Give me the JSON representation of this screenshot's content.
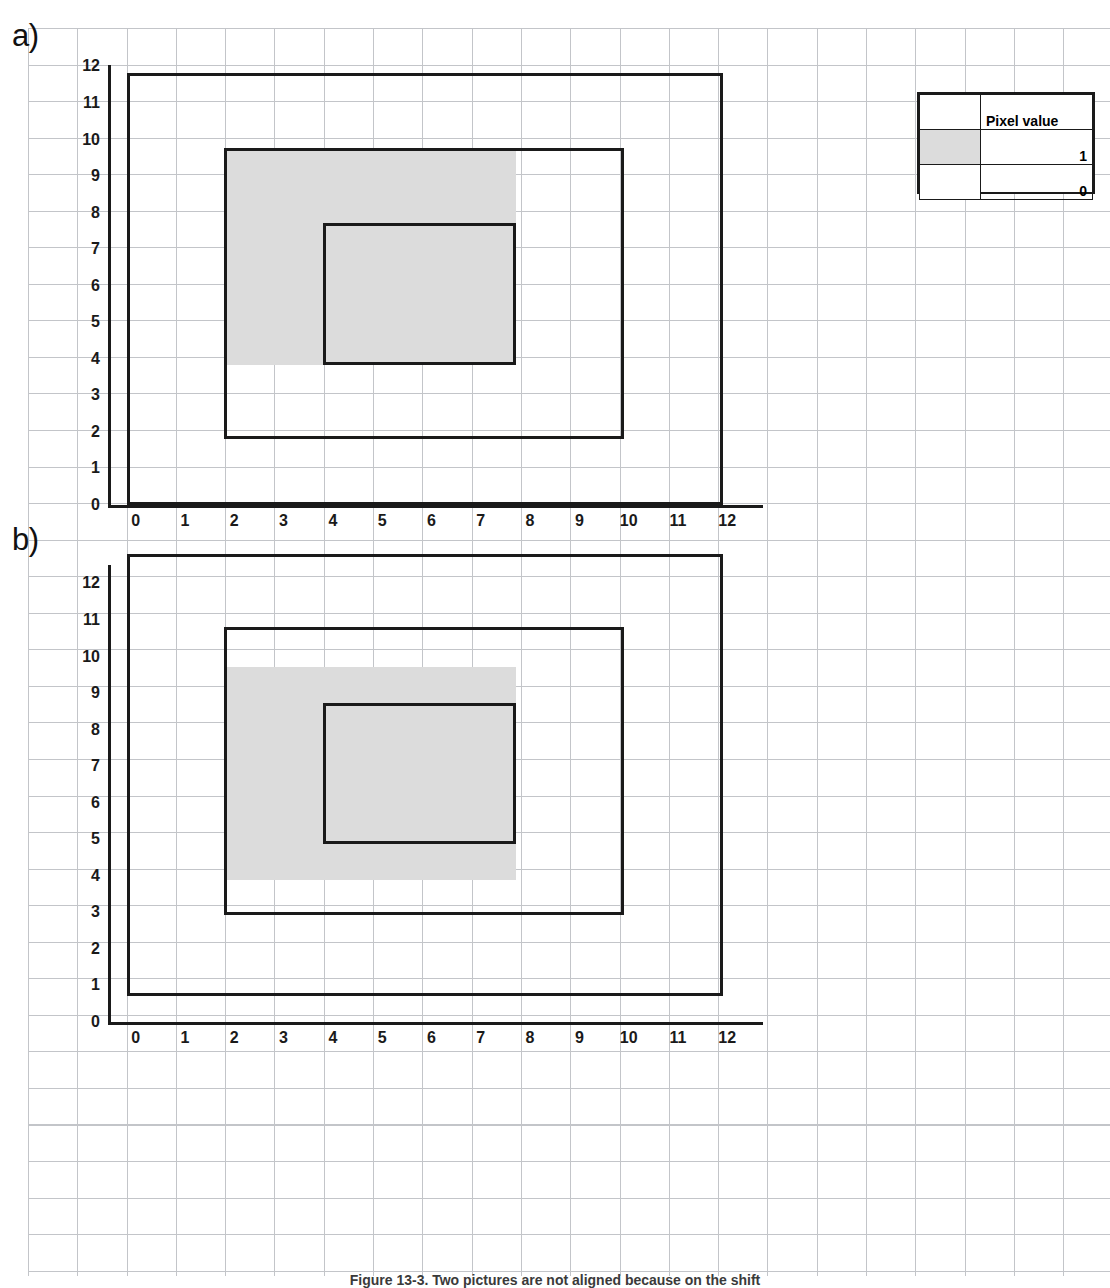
{
  "figure": {
    "panels": [
      {
        "tag": "a)",
        "x_axis": {
          "ticks": [
            "0",
            "1",
            "2",
            "3",
            "4",
            "5",
            "6",
            "7",
            "8",
            "9",
            "10",
            "11",
            "12"
          ]
        },
        "y_axis": {
          "ticks": [
            "12",
            "11",
            "10",
            "9",
            "8",
            "7",
            "6",
            "5",
            "4",
            "3",
            "2",
            "1",
            "0"
          ]
        },
        "shapes": [
          {
            "name": "outer-rectangle",
            "x0": 0.32,
            "x1": 12.42,
            "y0": 0.0,
            "y1": 11.82,
            "style": "outline"
          },
          {
            "name": "middle-rectangle",
            "x0": 2.3,
            "x1": 10.4,
            "y0": 1.8,
            "y1": 9.78,
            "style": "outline"
          },
          {
            "name": "gray-region",
            "x0": 2.3,
            "x1": 8.22,
            "y0": 3.82,
            "y1": 9.78,
            "style": "fill"
          },
          {
            "name": "inner-rectangle",
            "x0": 4.3,
            "x1": 8.22,
            "y0": 3.82,
            "y1": 7.72,
            "style": "outline"
          }
        ]
      },
      {
        "tag": "b)",
        "x_axis": {
          "ticks": [
            "0",
            "1",
            "2",
            "3",
            "4",
            "5",
            "6",
            "7",
            "8",
            "9",
            "10",
            "11",
            "12"
          ]
        },
        "y_axis": {
          "ticks": [
            "12",
            "11",
            "10",
            "9",
            "8",
            "7",
            "6",
            "5",
            "4",
            "3",
            "2",
            "1",
            "0"
          ]
        },
        "shapes": [
          {
            "name": "outer-rectangle",
            "x0": 0.32,
            "x1": 12.42,
            "y0": 0.72,
            "y1": 12.8,
            "style": "outline"
          },
          {
            "name": "middle-rectangle",
            "x0": 2.3,
            "x1": 10.4,
            "y0": 2.92,
            "y1": 10.8,
            "style": "outline"
          },
          {
            "name": "gray-region",
            "x0": 2.3,
            "x1": 8.22,
            "y0": 3.88,
            "y1": 9.72,
            "style": "fill"
          },
          {
            "name": "inner-rectangle",
            "x0": 4.3,
            "x1": 8.22,
            "y0": 4.88,
            "y1": 8.72,
            "style": "outline"
          }
        ]
      }
    ],
    "legend": {
      "header": "Pixel value",
      "rows": [
        {
          "swatch": "gray",
          "value": "1"
        },
        {
          "swatch": "white",
          "value": "0"
        }
      ]
    },
    "caption": "Figure 13-3.  Two pictures are not aligned because on the shift"
  },
  "colors": {
    "fill_gray": "#dcdcdc",
    "outline_black": "#1a1a1a",
    "grid_line": "#b9bcc0",
    "background": "#ffffff"
  },
  "chart_data": {
    "type": "diagram",
    "xlabel": "",
    "ylabel": "",
    "xlim": [
      0,
      12
    ],
    "ylim": [
      0,
      12
    ],
    "grid": true,
    "legend_position": "top-right",
    "series": [
      {
        "name": "panel a) shapes",
        "items": [
          {
            "label": "outer rectangle",
            "x": [
              0.3,
              12.4
            ],
            "y": [
              0.0,
              11.8
            ],
            "fill": "none"
          },
          {
            "label": "middle rectangle",
            "x": [
              2.3,
              10.4
            ],
            "y": [
              1.8,
              9.8
            ],
            "fill": "none"
          },
          {
            "label": "gray region (pixel value 1)",
            "x": [
              2.3,
              8.2
            ],
            "y": [
              3.8,
              9.8
            ],
            "fill": "#dcdcdc"
          },
          {
            "label": "inner rectangle",
            "x": [
              4.3,
              8.2
            ],
            "y": [
              3.8,
              7.7
            ],
            "fill": "none"
          }
        ]
      },
      {
        "name": "panel b) shapes",
        "items": [
          {
            "label": "outer rectangle",
            "x": [
              0.3,
              12.4
            ],
            "y": [
              0.7,
              12.8
            ],
            "fill": "none"
          },
          {
            "label": "middle rectangle",
            "x": [
              2.3,
              10.4
            ],
            "y": [
              2.9,
              10.8
            ],
            "fill": "none"
          },
          {
            "label": "gray region (pixel value 1)",
            "x": [
              2.3,
              8.2
            ],
            "y": [
              3.9,
              9.7
            ],
            "fill": "#dcdcdc"
          },
          {
            "label": "inner rectangle",
            "x": [
              4.3,
              8.2
            ],
            "y": [
              4.9,
              8.7
            ],
            "fill": "none"
          }
        ]
      }
    ]
  }
}
